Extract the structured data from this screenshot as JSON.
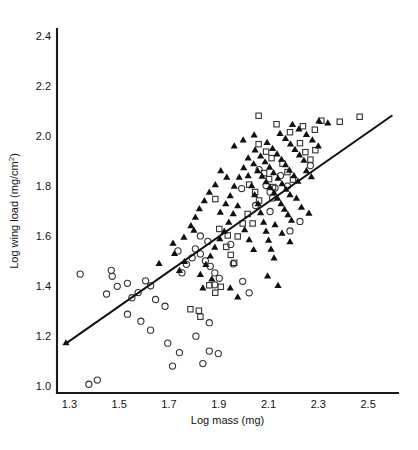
{
  "chart_data": {
    "type": "scatter",
    "title": "",
    "xlabel": "Log mass (mg)",
    "ylabel": "Log wing load (mg/cm2)",
    "ylabel_base": "Log wing load (mg/cm",
    "ylabel_sup": "2",
    "ylabel_tail": ")",
    "xlim": [
      1.25,
      2.62
    ],
    "ylim": [
      0.97,
      2.43
    ],
    "xticks": [
      1.3,
      1.5,
      1.7,
      1.9,
      2.1,
      2.3,
      2.5
    ],
    "yticks": [
      1.0,
      1.2,
      1.4,
      1.6,
      1.8,
      2.0,
      2.2,
      2.4
    ],
    "xtick_labels": [
      "1.3",
      "1.5",
      "1.7",
      "1.9",
      "2.1",
      "2.3",
      "2.5"
    ],
    "ytick_labels": [
      "1.0",
      "1.2",
      "1.4",
      "1.6",
      "1.8",
      "2.0",
      "2.2",
      "2.4"
    ],
    "grid": false,
    "legend": "none",
    "axis_style": "left-and-bottom-spines",
    "marker_colors": {
      "circle": "#333333",
      "square": "#333333",
      "triangle": "#111111"
    },
    "trendline": {
      "label": "regression line",
      "x": [
        1.285,
        2.595
      ],
      "y": [
        1.168,
        2.082
      ]
    },
    "series": [
      {
        "name": "open circles",
        "marker": "circle",
        "points": [
          [
            1.378,
            1.005
          ],
          [
            1.412,
            1.022
          ],
          [
            1.343,
            1.447
          ],
          [
            1.468,
            1.462
          ],
          [
            1.472,
            1.438
          ],
          [
            1.492,
            1.398
          ],
          [
            1.533,
            1.41
          ],
          [
            1.449,
            1.367
          ],
          [
            1.551,
            1.352
          ],
          [
            1.576,
            1.373
          ],
          [
            1.606,
            1.42
          ],
          [
            1.626,
            1.4
          ],
          [
            1.533,
            1.286
          ],
          [
            1.587,
            1.258
          ],
          [
            1.626,
            1.222
          ],
          [
            1.695,
            1.17
          ],
          [
            1.742,
            1.132
          ],
          [
            1.714,
            1.078
          ],
          [
            1.836,
            1.088
          ],
          [
            1.862,
            1.138
          ],
          [
            1.898,
            1.128
          ],
          [
            1.808,
            1.198
          ],
          [
            1.646,
            1.345
          ],
          [
            1.684,
            1.318
          ],
          [
            1.752,
            1.452
          ],
          [
            1.77,
            1.486
          ],
          [
            1.793,
            1.512
          ],
          [
            1.736,
            1.54
          ],
          [
            1.806,
            1.548
          ],
          [
            1.826,
            1.528
          ],
          [
            1.846,
            1.5
          ],
          [
            1.866,
            1.478
          ],
          [
            1.884,
            1.452
          ],
          [
            1.902,
            1.43
          ],
          [
            1.856,
            1.578
          ],
          [
            1.826,
            1.6
          ],
          [
            1.884,
            1.404
          ],
          [
            1.958,
            1.488
          ],
          [
            1.948,
            1.566
          ],
          [
            1.862,
            1.252
          ],
          [
            1.992,
            1.79
          ],
          [
            2.048,
            1.722
          ],
          [
            2.062,
            1.866
          ],
          [
            2.09,
            1.802
          ],
          [
            2.106,
            1.776
          ],
          [
            2.126,
            1.792
          ],
          [
            2.116,
            1.752
          ],
          [
            2.106,
            1.698
          ],
          [
            2.148,
            1.842
          ],
          [
            2.176,
            1.8
          ],
          [
            2.186,
            1.62
          ],
          [
            2.226,
            1.658
          ],
          [
            2.268,
            1.882
          ],
          [
            1.996,
            1.418
          ],
          [
            2.022,
            1.372
          ]
        ]
      },
      {
        "name": "open squares",
        "marker": "square",
        "points": [
          [
            1.786,
            1.306
          ],
          [
            1.82,
            1.3
          ],
          [
            1.826,
            1.276
          ],
          [
            1.862,
            1.402
          ],
          [
            1.886,
            1.372
          ],
          [
            1.908,
            1.396
          ],
          [
            1.93,
            1.556
          ],
          [
            1.948,
            1.524
          ],
          [
            1.962,
            1.492
          ],
          [
            1.902,
            1.628
          ],
          [
            1.936,
            1.602
          ],
          [
            1.996,
            1.65
          ],
          [
            2.016,
            1.688
          ],
          [
            2.036,
            1.65
          ],
          [
            2.022,
            1.806
          ],
          [
            2.046,
            1.776
          ],
          [
            2.062,
            1.742
          ],
          [
            2.082,
            1.852
          ],
          [
            2.102,
            1.828
          ],
          [
            2.118,
            1.796
          ],
          [
            2.06,
            1.968
          ],
          [
            2.09,
            1.938
          ],
          [
            2.112,
            1.912
          ],
          [
            2.156,
            1.89
          ],
          [
            2.176,
            1.856
          ],
          [
            2.198,
            1.826
          ],
          [
            2.132,
            2.048
          ],
          [
            2.186,
            2.016
          ],
          [
            2.226,
            1.972
          ],
          [
            2.248,
            1.936
          ],
          [
            2.268,
            1.906
          ],
          [
            2.288,
            1.944
          ],
          [
            2.312,
            2.062
          ],
          [
            2.386,
            2.058
          ],
          [
            2.466,
            2.078
          ],
          [
            2.238,
            2.04
          ],
          [
            2.286,
            2.026
          ],
          [
            2.06,
            2.082
          ],
          [
            1.886,
            1.748
          ],
          [
            1.976,
            1.598
          ]
        ]
      },
      {
        "name": "filled triangles",
        "marker": "triangle",
        "points": [
          [
            1.286,
            1.172
          ],
          [
            1.716,
            1.572
          ],
          [
            1.76,
            1.596
          ],
          [
            1.8,
            1.624
          ],
          [
            1.826,
            1.446
          ],
          [
            1.848,
            1.486
          ],
          [
            1.866,
            1.52
          ],
          [
            1.884,
            1.556
          ],
          [
            1.904,
            1.59
          ],
          [
            1.922,
            1.62
          ],
          [
            1.94,
            1.656
          ],
          [
            1.958,
            1.69
          ],
          [
            1.976,
            1.722
          ],
          [
            1.836,
            1.392
          ],
          [
            1.872,
            1.428
          ],
          [
            1.906,
            1.696
          ],
          [
            1.928,
            1.73
          ],
          [
            1.946,
            1.762
          ],
          [
            1.962,
            1.8
          ],
          [
            1.982,
            1.836
          ],
          [
            2.0,
            1.874
          ],
          [
            2.018,
            1.842
          ],
          [
            2.032,
            1.802
          ],
          [
            2.044,
            1.766
          ],
          [
            2.058,
            1.73
          ],
          [
            2.068,
            1.694
          ],
          [
            2.08,
            1.656
          ],
          [
            2.09,
            1.62
          ],
          [
            2.1,
            1.584
          ],
          [
            2.11,
            1.548
          ],
          [
            2.122,
            1.512
          ],
          [
            2.018,
            1.914
          ],
          [
            2.04,
            1.89
          ],
          [
            2.056,
            1.862
          ],
          [
            2.074,
            1.84
          ],
          [
            2.09,
            1.818
          ],
          [
            2.106,
            1.796
          ],
          [
            2.122,
            1.774
          ],
          [
            2.136,
            1.752
          ],
          [
            2.15,
            1.73
          ],
          [
            2.164,
            1.708
          ],
          [
            2.178,
            1.686
          ],
          [
            2.192,
            1.664
          ],
          [
            2.046,
            1.946
          ],
          [
            2.068,
            1.922
          ],
          [
            2.086,
            1.898
          ],
          [
            2.104,
            1.876
          ],
          [
            2.12,
            1.854
          ],
          [
            2.138,
            1.832
          ],
          [
            2.154,
            1.81
          ],
          [
            2.17,
            1.788
          ],
          [
            2.186,
            1.766
          ],
          [
            2.094,
            1.976
          ],
          [
            2.116,
            1.952
          ],
          [
            2.134,
            1.93
          ],
          [
            2.152,
            1.908
          ],
          [
            2.168,
            1.886
          ],
          [
            2.184,
            1.864
          ],
          [
            2.202,
            1.842
          ],
          [
            2.218,
            1.82
          ],
          [
            2.146,
            2.012
          ],
          [
            2.168,
            1.992
          ],
          [
            2.188,
            1.97
          ],
          [
            2.206,
            1.948
          ],
          [
            2.224,
            1.926
          ],
          [
            2.242,
            1.904
          ],
          [
            2.196,
            2.048
          ],
          [
            2.222,
            2.03
          ],
          [
            2.252,
            2.008
          ],
          [
            2.276,
            1.986
          ],
          [
            2.3,
            1.962
          ],
          [
            1.962,
            1.962
          ],
          [
            1.998,
            1.986
          ],
          [
            2.042,
            2.006
          ],
          [
            2.302,
            2.062
          ],
          [
            2.338,
            2.054
          ],
          [
            2.252,
            1.862
          ],
          [
            2.272,
            1.838
          ],
          [
            2.212,
            1.752
          ],
          [
            2.232,
            1.716
          ],
          [
            2.262,
            1.692
          ],
          [
            2.126,
            1.646
          ],
          [
            2.154,
            1.612
          ],
          [
            2.186,
            1.578
          ],
          [
            1.908,
            1.862
          ],
          [
            1.932,
            1.836
          ],
          [
            1.886,
            1.806
          ],
          [
            1.862,
            1.776
          ],
          [
            1.842,
            1.742
          ],
          [
            1.822,
            1.71
          ],
          [
            1.806,
            1.676
          ],
          [
            1.788,
            1.642
          ],
          [
            1.762,
            1.498
          ],
          [
            1.742,
            1.462
          ],
          [
            2.004,
            1.626
          ],
          [
            2.022,
            1.586
          ],
          [
            2.04,
            1.546
          ],
          [
            1.722,
            1.53
          ],
          [
            1.66,
            1.49
          ],
          [
            2.096,
            1.44
          ],
          [
            2.138,
            1.402
          ],
          [
            1.946,
            1.392
          ],
          [
            1.976,
            1.356
          ]
        ]
      }
    ]
  }
}
